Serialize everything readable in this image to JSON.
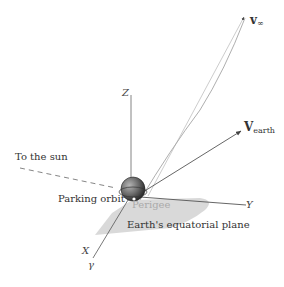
{
  "diagram": {
    "type": "3D orbital departure geometry",
    "axes": {
      "x_label": "X",
      "y_label": "Y",
      "z_label": "Z",
      "vernal_equinox_symbol": "γ"
    },
    "labels": {
      "sun_direction": "To the sun",
      "parking_orbit": "Parking orbit",
      "perigee": "Perigee",
      "equatorial_plane": "Earth's equatorial plane"
    },
    "vectors": {
      "v_infinity": {
        "symbol": "v",
        "subscript": "∞"
      },
      "v_earth": {
        "symbol": "V",
        "subscript": "earth"
      }
    },
    "colors": {
      "line": "#555555",
      "plane_fill": "#d9d9d9",
      "earth_dark": "#3a3a3a",
      "earth_light": "#9a9a9a",
      "perigee_text": "#aaaaaa"
    }
  }
}
